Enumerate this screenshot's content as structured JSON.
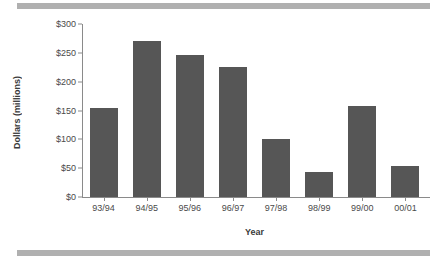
{
  "chart_data": {
    "type": "bar",
    "title": "",
    "subtitle": "",
    "xlabel": "Year",
    "ylabel": "Dollars (millions)",
    "categories": [
      "93/94",
      "94/95",
      "95/96",
      "96/97",
      "97/98",
      "98/99",
      "99/00",
      "00/01"
    ],
    "values": [
      155,
      270,
      247,
      225,
      100,
      43,
      157,
      54
    ],
    "ylim": [
      0,
      300
    ],
    "yticks": [
      0,
      50,
      100,
      150,
      200,
      250,
      300
    ],
    "ytick_labels": [
      "$0",
      "$50",
      "$100",
      "$150",
      "$200",
      "$250",
      "$300"
    ],
    "grid": false,
    "legend": null,
    "series": [
      {
        "name": "Dollars (millions)",
        "values": [
          155,
          270,
          247,
          225,
          100,
          43,
          157,
          54
        ]
      }
    ],
    "colors": {
      "bar_fill": "#565656",
      "axis": "#8a8a8a",
      "tick_text": "#4a4a4a",
      "axis_title": "#3a3a3a",
      "decorative_band": "#b0b0b0",
      "background": "#ffffff"
    }
  }
}
